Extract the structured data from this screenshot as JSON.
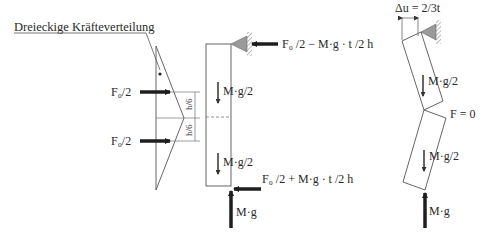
{
  "diagram": {
    "title_label": "Dreieckige Kräfteverteilung",
    "left": {
      "force_top_label": "F₀/2",
      "force_bottom_label": "F₀/2",
      "dim_top": "h/6",
      "dim_bottom": "h/6"
    },
    "middle": {
      "top_reaction_label": "F₀ /2 − M·g · t /2 h",
      "weight_upper_label": "M·g/2",
      "weight_lower_label": "M·g/2",
      "bottom_reaction_label": "F₀ /2 + M·g · t /2 h",
      "vertical_reaction_label": "M·g"
    },
    "right": {
      "displacement_label": "Δu = 2/3t",
      "weight_upper_label": "M·g/2",
      "joint_force_label": "F = 0",
      "weight_lower_label": "M·g/2",
      "vertical_reaction_label": "M·g"
    }
  },
  "colors": {
    "line": "#555555",
    "arrow": "#1e1e1e",
    "support_fill": "#9a9a9a",
    "text": "#2a2a2a"
  }
}
